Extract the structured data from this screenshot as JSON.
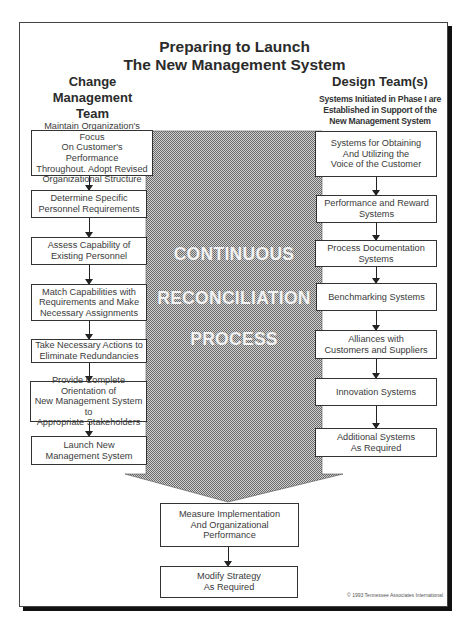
{
  "title": {
    "line1": "Preparing to Launch",
    "line2": "The New Management System"
  },
  "left_column": {
    "heading_line1": "Change",
    "heading_line2": "Management",
    "heading_line3": "Team",
    "boxes": [
      {
        "l1": "Maintain Organization's Focus",
        "l2": "On Customer's Performance",
        "l3": "Throughout. Adopt Revised",
        "l4": "Organizational Structure"
      },
      {
        "l1": "Determine Specific",
        "l2": "Personnel Requirements"
      },
      {
        "l1": "Assess Capability of",
        "l2": "Existing Personnel"
      },
      {
        "l1": "Match Capabilities with",
        "l2": "Requirements and Make",
        "l3": "Necessary Assignments"
      },
      {
        "l1": "Take Necessary Actions to",
        "l2": "Eliminate Redundancies"
      },
      {
        "l1": "Provide Complete Orientation of",
        "l2": "New Management System to",
        "l3": "Appropriate Stakeholders"
      },
      {
        "l1": "Launch New",
        "l2": "Management System"
      }
    ]
  },
  "right_column": {
    "heading": "Design Team(s)",
    "subheading_line1": "Systems Initiated in Phase I are",
    "subheading_line2": "Established in Support of the",
    "subheading_line3": "New Management System",
    "boxes": [
      {
        "l1": "Systems for Obtaining",
        "l2": "And Utilizing the",
        "l3": "Voice of the Customer"
      },
      {
        "l1": "Performance and Reward",
        "l2": "Systems"
      },
      {
        "l1": "Process Documentation Systems"
      },
      {
        "l1": "Benchmarking Systems"
      },
      {
        "l1": "Alliances with",
        "l2": "Customers and Suppliers"
      },
      {
        "l1": "Innovation Systems"
      },
      {
        "l1": "Additional Systems",
        "l2": "As Required"
      }
    ]
  },
  "center": {
    "word1": "CONTINUOUS",
    "word2": "RECONCILIATION",
    "word3": "PROCESS",
    "pattern_color_dark": "#6e6e6e",
    "pattern_color_light": "#d4d4d4"
  },
  "bottom_boxes": [
    {
      "l1": "Measure Implementation",
      "l2": "And Organizational",
      "l3": "Performance"
    },
    {
      "l1": "Modify Strategy",
      "l2": "As Required"
    }
  ],
  "copyright": "© 1993 Tennessee Associates International"
}
